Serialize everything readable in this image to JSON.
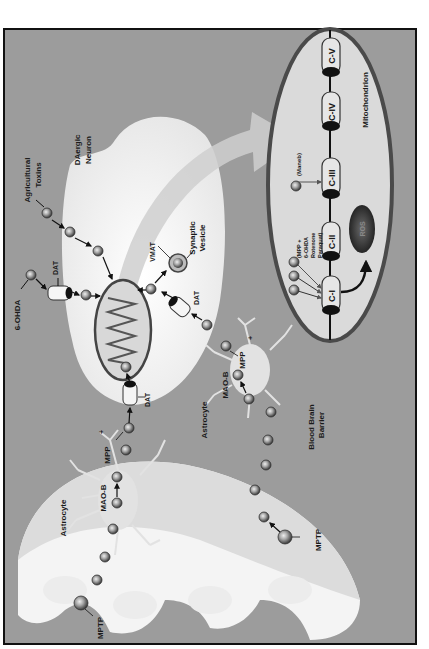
{
  "figure": {
    "orientation": "rotated-90-ccw",
    "colors": {
      "background": "#9c9c9c",
      "frame": "#111111",
      "cell": "#f2f2f2",
      "mito_fill": "#dadada",
      "mito_outline": "#4a4a4a",
      "particle": "#8a8a8a",
      "ros": "#2e2e2e"
    },
    "labels": {
      "agricultural_toxins": [
        "Agricultural",
        "Toxins"
      ],
      "daergic_neuron": [
        "DAergic",
        "Neuron"
      ],
      "synaptic_vesicle": [
        "Synaptic",
        "Vesicle"
      ],
      "vmat": "VMAT",
      "dat_top": "DAT",
      "dat_right": "DAT",
      "dat_bottom": "DAT",
      "six_ohda": "6-OHDA",
      "mpp_upper": "MPP",
      "mpp_upper_sup": "+",
      "mpp_lower": "MPP",
      "mpp_lower_sup": "+",
      "mao_b_left": "MAO-B",
      "mao_b_right": "MAO-B",
      "astrocyte_left": "Astrocyte",
      "astrocyte_right": "Astrocyte",
      "blood_brain_barrier": [
        "Blood Brain",
        "Barrier"
      ],
      "mptp_left": "MPTP",
      "mptp_right": "MPTP",
      "mitochondrion": "Mitochondrion",
      "maneb": "(Maneb)",
      "complex_i_inhibitors": [
        "(MPP +",
        "6-OHDA",
        "Rotenone",
        "Paraquat)"
      ],
      "ros": "ROS"
    },
    "complexes": [
      "C-I",
      "C-II",
      "C-III",
      "C-IV",
      "C-V"
    ]
  }
}
